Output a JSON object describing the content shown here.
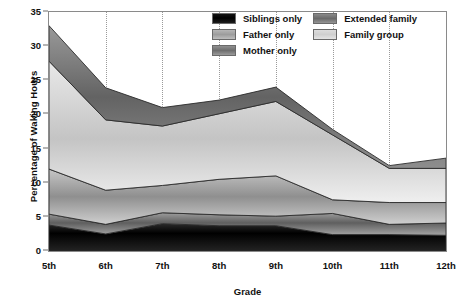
{
  "chart_data": {
    "type": "area",
    "stacked": true,
    "title": "",
    "xlabel": "Grade",
    "ylabel": "Percentage of Waking Hours",
    "categories": [
      "5th",
      "6th",
      "7th",
      "8th",
      "9th",
      "10th",
      "11th",
      "12th"
    ],
    "ylim": [
      0,
      35
    ],
    "yticks": [
      0,
      5,
      10,
      15,
      20,
      25,
      30,
      35
    ],
    "grid": "vertical-dotted",
    "legend_position": "top-right-inside",
    "series": [
      {
        "name": "Siblings only",
        "color": "#000000",
        "values": [
          3.8,
          2.5,
          4.0,
          3.7,
          3.7,
          2.4,
          2.4,
          2.3
        ]
      },
      {
        "name": "Mother only",
        "color": "#6e6e6e",
        "values": [
          1.6,
          1.4,
          1.6,
          1.6,
          1.4,
          3.1,
          1.5,
          1.8
        ]
      },
      {
        "name": "Father only",
        "color": "#9c9c9c",
        "values": [
          6.6,
          5.0,
          4.0,
          5.2,
          5.9,
          2.0,
          3.2,
          3.0
        ]
      },
      {
        "name": "Family group",
        "color": "#d4d4d4",
        "values": [
          15.8,
          10.3,
          8.7,
          9.6,
          10.9,
          9.5,
          5.0,
          5.0
        ]
      },
      {
        "name": "Extended family",
        "color": "#6a6a6a",
        "values": [
          5.2,
          4.7,
          2.7,
          2.0,
          2.1,
          0.8,
          0.4,
          1.5
        ]
      }
    ],
    "cumulative_tops": {
      "siblings_only": [
        3.8,
        2.5,
        4.0,
        3.7,
        3.7,
        2.4,
        2.4,
        2.3
      ],
      "mother_only": [
        5.4,
        3.9,
        5.6,
        5.3,
        5.1,
        5.5,
        3.9,
        4.1
      ],
      "father_only": [
        12.0,
        8.9,
        9.6,
        10.5,
        11.0,
        7.5,
        7.1,
        7.1
      ],
      "family_group": [
        27.8,
        19.2,
        18.3,
        20.1,
        21.9,
        17.0,
        12.1,
        12.1
      ],
      "extended_family": [
        33.0,
        23.9,
        21.0,
        22.1,
        24.0,
        17.8,
        12.5,
        13.6
      ]
    }
  },
  "legend": {
    "items": [
      {
        "label": "Siblings only",
        "swatch": "sw-siblings"
      },
      {
        "label": "Extended family",
        "swatch": "sw-extended"
      },
      {
        "label": "Father only",
        "swatch": "sw-father"
      },
      {
        "label": "Family group",
        "swatch": "sw-family"
      },
      {
        "label": "Mother only",
        "swatch": "sw-mother"
      }
    ]
  }
}
